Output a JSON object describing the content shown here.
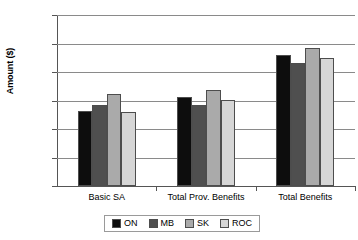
{
  "chart_data": {
    "type": "bar",
    "title": "",
    "xlabel": "",
    "ylabel": "Amount ($)",
    "ylim": [
      0,
      30000
    ],
    "ytick_values": [
      0,
      5000,
      10000,
      15000,
      20000,
      25000,
      30000
    ],
    "ytick_labels": [
      "0",
      "5,000",
      "10,000",
      "15,000",
      "20,000",
      "25,000",
      "30,000"
    ],
    "grid": true,
    "legend_position": "bottom",
    "categories": [
      "Basic SA",
      "Total Prov. Benefits",
      "Total Benefits"
    ],
    "series": [
      {
        "name": "ON",
        "color": "#0d0d0d",
        "values": [
          13200,
          15600,
          22900
        ]
      },
      {
        "name": "MB",
        "color": "#4f4f4f",
        "values": [
          14200,
          14300,
          21600
        ]
      },
      {
        "name": "SK",
        "color": "#aaaaaa",
        "values": [
          16100,
          16800,
          24200
        ]
      },
      {
        "name": "ROC",
        "color": "#d6d6d6",
        "values": [
          12900,
          15100,
          22400
        ]
      }
    ]
  },
  "legend": {
    "items": [
      {
        "label": "ON",
        "color": "#0d0d0d"
      },
      {
        "label": "MB",
        "color": "#4f4f4f"
      },
      {
        "label": "SK",
        "color": "#aaaaaa"
      },
      {
        "label": "ROC",
        "color": "#d6d6d6"
      }
    ]
  }
}
